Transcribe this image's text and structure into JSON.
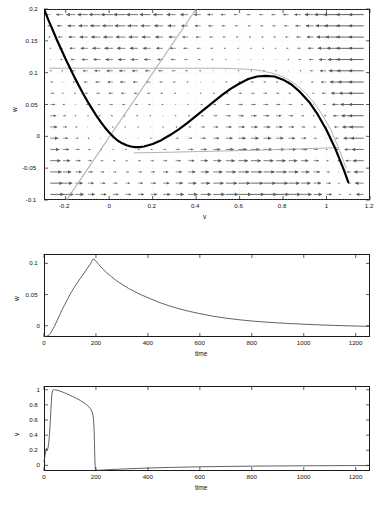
{
  "figure": {
    "title": "",
    "panels": [
      "phase-plane",
      "w-time-series",
      "v-time-series"
    ]
  },
  "chart_data": [
    {
      "type": "line",
      "name": "phase-plane",
      "title": "",
      "xlabel": "v",
      "ylabel": "w",
      "xlim": [
        -0.3,
        1.2
      ],
      "ylim": [
        -0.1,
        0.2
      ],
      "xticks": [
        -0.2,
        0,
        0.2,
        0.4,
        0.6,
        0.8,
        1,
        1.2
      ],
      "xticklabels": [
        "-0.2",
        "0",
        "0.2",
        "0.4",
        "0.6",
        "0.8",
        "1",
        "1.2"
      ],
      "yticks": [
        -0.1,
        -0.05,
        0,
        0.05,
        0.1,
        0.15,
        0.2
      ],
      "yticklabels": [
        "-0.1",
        "-0.05",
        "0",
        "0.05",
        "0.1",
        "0.15",
        "0.2"
      ],
      "grid": false,
      "legend": "none",
      "series": [
        {
          "name": "v-nullcline-cubic",
          "style": "thick-black",
          "color": "#000000",
          "width": 2.2,
          "comment": "cubic nullcline w = v(1-v)(v-a) style curve",
          "x": [
            -0.3,
            -0.28,
            -0.26,
            -0.24,
            -0.22,
            -0.2,
            -0.18,
            -0.16,
            -0.14,
            -0.12,
            -0.1,
            -0.08,
            -0.06,
            -0.04,
            -0.02,
            0.0,
            0.02,
            0.04,
            0.06,
            0.08,
            0.1,
            0.12,
            0.14,
            0.16,
            0.18,
            0.2,
            0.24,
            0.28,
            0.32,
            0.36,
            0.4,
            0.44,
            0.48,
            0.52,
            0.56,
            0.6,
            0.64,
            0.68,
            0.72,
            0.76,
            0.8,
            0.84,
            0.88,
            0.92,
            0.96,
            1.0,
            1.04,
            1.08,
            1.1
          ],
          "y": [
            0.2,
            0.183,
            0.167,
            0.151,
            0.136,
            0.121,
            0.107,
            0.093,
            0.08,
            0.067,
            0.055,
            0.044,
            0.033,
            0.023,
            0.014,
            0.006,
            -0.001,
            -0.007,
            -0.011,
            -0.014,
            -0.016,
            -0.017,
            -0.017,
            -0.016,
            -0.014,
            -0.012,
            -0.006,
            0.002,
            0.011,
            0.021,
            0.032,
            0.043,
            0.054,
            0.065,
            0.075,
            0.083,
            0.09,
            0.094,
            0.095,
            0.094,
            0.089,
            0.081,
            0.069,
            0.054,
            0.034,
            0.01,
            -0.019,
            -0.053,
            -0.072
          ]
        },
        {
          "name": "w-nullcline-line",
          "style": "thin-gray",
          "color": "#b0b0b0",
          "width": 1.1,
          "comment": "straight w-nullcline through origin, slope ~0.52",
          "x": [
            -0.2,
            0.4
          ],
          "y": [
            -0.102,
            0.2
          ]
        },
        {
          "name": "trajectory-upper",
          "style": "thin-gray",
          "color": "#a8a8a8",
          "width": 0.9,
          "x": [
            -0.275,
            -0.2,
            -0.1,
            0.0,
            0.1,
            0.2,
            0.3,
            0.4,
            0.5,
            0.6,
            0.66,
            0.7,
            0.74,
            0.78,
            0.82,
            0.86,
            0.9,
            0.94,
            0.98,
            1.02,
            1.06,
            1.09
          ],
          "y": [
            0.107,
            0.107,
            0.107,
            0.107,
            0.107,
            0.107,
            0.107,
            0.107,
            0.107,
            0.106,
            0.105,
            0.103,
            0.1,
            0.096,
            0.09,
            0.081,
            0.069,
            0.054,
            0.034,
            0.01,
            -0.022,
            -0.05
          ]
        },
        {
          "name": "trajectory-lower",
          "style": "thin-gray",
          "color": "#a8a8a8",
          "width": 0.9,
          "x": [
            0.115,
            0.2,
            0.3,
            0.4,
            0.5,
            0.6,
            0.7,
            0.8,
            0.9,
            1.0,
            1.05
          ],
          "y": [
            -0.026,
            -0.0255,
            -0.0248,
            -0.024,
            -0.0232,
            -0.0224,
            -0.0215,
            -0.0205,
            -0.0195,
            -0.0183,
            -0.0176
          ]
        }
      ],
      "vector_field": {
        "description": "quiver arrows on a regular grid; arrows point right in lower/left region and left in upper/right region, magnitude grows toward right edge",
        "nx": 26,
        "ny": 17,
        "color": "#5a5a5a"
      }
    },
    {
      "type": "line",
      "name": "w-time-series",
      "title": "",
      "xlabel": "time",
      "ylabel": "w",
      "xlim": [
        0,
        1255
      ],
      "ylim": [
        -0.018,
        0.115
      ],
      "xticks": [
        0,
        200,
        400,
        600,
        800,
        1000,
        1200
      ],
      "xticklabels": [
        "0",
        "200",
        "400",
        "600",
        "800",
        "1000",
        "1200"
      ],
      "yticks": [
        0,
        0.05,
        0.1
      ],
      "yticklabels": [
        "0",
        "0.05",
        "0.1"
      ],
      "grid": false,
      "legend": "none",
      "series": [
        {
          "name": "w(t)",
          "color": "#3a3a3a",
          "width": 0.8,
          "x": [
            0,
            5,
            10,
            15,
            20,
            25,
            30,
            40,
            50,
            60,
            70,
            80,
            90,
            100,
            110,
            120,
            130,
            140,
            150,
            160,
            170,
            180,
            188,
            192,
            200,
            210,
            225,
            240,
            260,
            280,
            300,
            325,
            350,
            375,
            400,
            440,
            480,
            520,
            560,
            600,
            650,
            700,
            750,
            800,
            850,
            900,
            950,
            1000,
            1060,
            1120,
            1180,
            1250
          ],
          "y": [
            -0.016,
            -0.017,
            -0.0168,
            -0.016,
            -0.0145,
            -0.012,
            -0.0085,
            -0.001,
            0.008,
            0.017,
            0.026,
            0.034,
            0.042,
            0.05,
            0.057,
            0.064,
            0.07,
            0.076,
            0.082,
            0.088,
            0.094,
            0.1,
            0.1065,
            0.107,
            0.1035,
            0.0985,
            0.0915,
            0.0855,
            0.0785,
            0.072,
            0.0665,
            0.06,
            0.0545,
            0.0495,
            0.045,
            0.038,
            0.0322,
            0.0272,
            0.023,
            0.0194,
            0.0154,
            0.0122,
            0.0097,
            0.0076,
            0.006,
            0.0046,
            0.0035,
            0.0025,
            0.0014,
            0.0005,
            -0.0002,
            -0.001
          ]
        }
      ]
    },
    {
      "type": "line",
      "name": "v-time-series",
      "title": "",
      "xlabel": "time",
      "ylabel": "v",
      "xlim": [
        0,
        1255
      ],
      "ylim": [
        -0.075,
        1.05
      ],
      "xticks": [
        0,
        200,
        400,
        600,
        800,
        1000,
        1200
      ],
      "xticklabels": [
        "0",
        "200",
        "400",
        "600",
        "800",
        "1000",
        "1200"
      ],
      "yticks": [
        0,
        0.2,
        0.4,
        0.6,
        0.8,
        1
      ],
      "yticklabels": [
        "0",
        "0.2",
        "0.4",
        "0.6",
        "0.8",
        "1"
      ],
      "grid": false,
      "legend": "none",
      "series": [
        {
          "name": "v(t)",
          "color": "#3a3a3a",
          "width": 0.8,
          "x": [
            0,
            3,
            6,
            9,
            12,
            15,
            18,
            21,
            24,
            27,
            30,
            33,
            36,
            40,
            45,
            50,
            60,
            70,
            80,
            90,
            100,
            110,
            120,
            130,
            140,
            150,
            160,
            170,
            178,
            184,
            188,
            191,
            193,
            194,
            195,
            196,
            197,
            198,
            200,
            205,
            215,
            230,
            250,
            275,
            300,
            330,
            360,
            400,
            440,
            480,
            520,
            560,
            600,
            650,
            700,
            750,
            800,
            850,
            900,
            950,
            1000,
            1060,
            1120,
            1180,
            1250
          ],
          "y": [
            0.05,
            0.11,
            0.175,
            0.225,
            0.205,
            0.225,
            0.29,
            0.4,
            0.56,
            0.76,
            0.93,
            0.99,
            1.0,
            1.0,
            0.998,
            0.994,
            0.984,
            0.972,
            0.958,
            0.944,
            0.928,
            0.912,
            0.895,
            0.877,
            0.858,
            0.836,
            0.812,
            0.784,
            0.755,
            0.718,
            0.678,
            0.6,
            0.47,
            0.33,
            0.18,
            0.06,
            -0.02,
            -0.05,
            -0.063,
            -0.066,
            -0.064,
            -0.061,
            -0.057,
            -0.053,
            -0.049,
            -0.045,
            -0.041,
            -0.036,
            -0.032,
            -0.028,
            -0.025,
            -0.022,
            -0.02,
            -0.017,
            -0.0146,
            -0.0126,
            -0.0109,
            -0.0094,
            -0.0081,
            -0.007,
            -0.006,
            -0.0049,
            -0.004,
            -0.0033,
            -0.0026
          ]
        }
      ]
    }
  ],
  "phase": {
    "xlabel": "v",
    "ylabel": "w",
    "xticklabels": [
      "-0.2",
      "0",
      "0.2",
      "0.4",
      "0.6",
      "0.8",
      "1",
      "1.2"
    ],
    "yticklabels": [
      "-0.1",
      "-0.05",
      "0",
      "0.05",
      "0.1",
      "0.15",
      "0.2"
    ]
  },
  "mid": {
    "xlabel": "time",
    "ylabel": "w",
    "xticklabels": [
      "0",
      "200",
      "400",
      "600",
      "800",
      "1000",
      "1200"
    ],
    "yticklabels": [
      "0",
      "0.05",
      "0.1"
    ]
  },
  "bot": {
    "xlabel": "time",
    "ylabel": "v",
    "xticklabels": [
      "0",
      "200",
      "400",
      "600",
      "800",
      "1000",
      "1200"
    ],
    "yticklabels": [
      "0",
      "0.2",
      "0.4",
      "0.6",
      "0.8",
      "1"
    ]
  }
}
